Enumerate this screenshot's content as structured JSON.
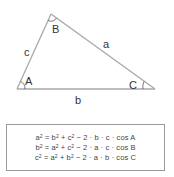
{
  "triangle": {
    "vertices": {
      "A": {
        "label": "A",
        "x": 17,
        "y": 89
      },
      "B": {
        "label": "B",
        "x": 51,
        "y": 14
      },
      "C": {
        "label": "C",
        "x": 155,
        "y": 89
      }
    },
    "sides": {
      "a": {
        "label": "a"
      },
      "b": {
        "label": "b"
      },
      "c": {
        "label": "c"
      }
    },
    "line_color": "#a8a8a8",
    "label_color": "#333333"
  },
  "formulas": [
    {
      "lhs": "a",
      "t1": "b",
      "t2": "c",
      "p1": "b",
      "p2": "c",
      "angle": "A"
    },
    {
      "lhs": "b",
      "t1": "a",
      "t2": "c",
      "p1": "a",
      "p2": "c",
      "angle": "B"
    },
    {
      "lhs": "c",
      "t1": "a",
      "t2": "b",
      "p1": "a",
      "p2": "b",
      "angle": "C"
    }
  ],
  "formula_text": [
    "a² = b² + c² − 2 · b · c · cos A",
    "b² = a² + c² − 2 · a · c · cos B",
    "c² = a² + b² − 2 · a · b · cos C"
  ],
  "formula_parts": {
    "exp": "2",
    "eq": " = ",
    "plus": " + ",
    "minus": " − 2 · ",
    "dot": " · ",
    "cos": " · cos "
  }
}
